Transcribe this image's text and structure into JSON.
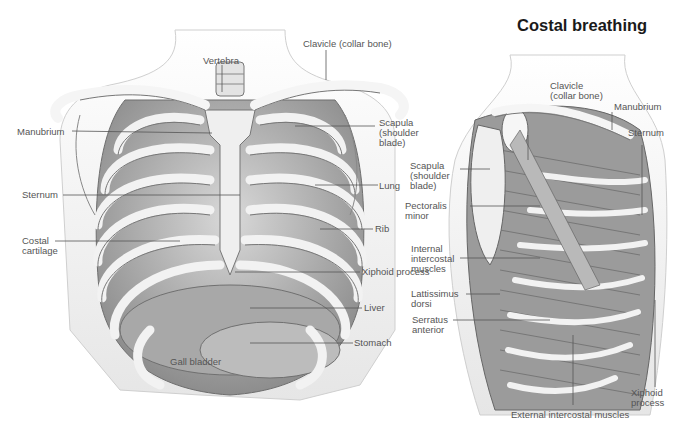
{
  "figure": {
    "colors": {
      "background": "#ffffff",
      "bone": "#eeeeee",
      "shade": "#9a9a9a",
      "outline": "#555555",
      "label_text": "#555555",
      "title_text": "#1a1a1a"
    }
  },
  "left_panel": {
    "title_cropped": true,
    "labels": {
      "vertebra": "Vertebra",
      "clavicle": "Clavicle (collar bone)",
      "manubrium": "Manubrium",
      "scapula": "Scapula\n(shoulder\nblade)",
      "sternum": "Sternum",
      "lung": "Lung",
      "costal_cartilage": "Costal\ncartilage",
      "rib": "Rib",
      "xiphoid": "Xiphoid process",
      "liver": "Liver",
      "stomach": "Stomach",
      "gall_bladder": "Gall bladder"
    }
  },
  "right_panel": {
    "title": "Costal breathing",
    "labels": {
      "clavicle": "Clavicle\n(collar bone)",
      "manubrium": "Manubrium",
      "sternum": "Sternum",
      "scapula": "Scapula\n(shoulder\nblade)",
      "pectoralis": "Pectoralis\nminor",
      "internal_intercostal": "Internal\nintercostal\nmuscles",
      "lattissimus": "Lattissimus\ndorsi",
      "serratus": "Serratus\nanterior",
      "xiphoid": "Xiphoid\nprocess",
      "external_intercostal": "External intercostal muscles"
    }
  }
}
